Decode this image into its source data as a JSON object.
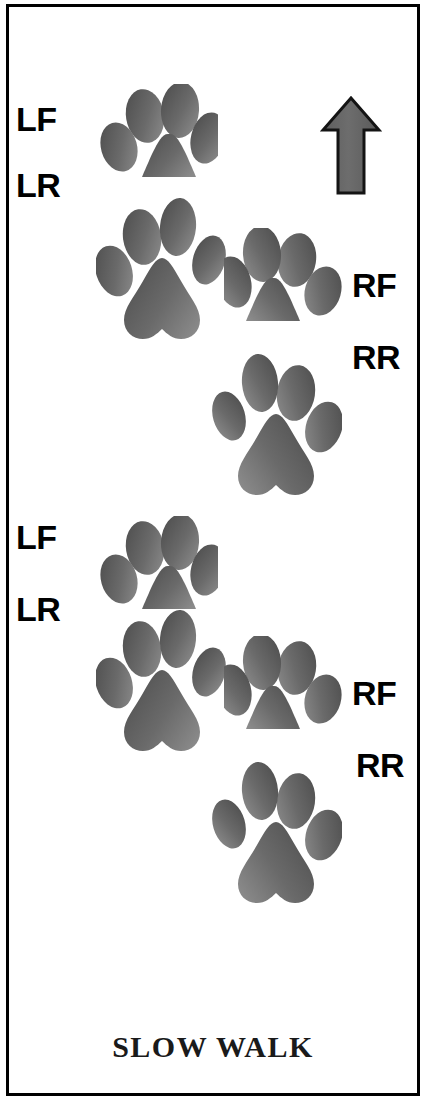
{
  "diagram": {
    "title": "SLOW WALK",
    "caption": "SLOW WALK",
    "direction_icon": "up-arrow-icon",
    "direction": "up",
    "background_color": "#ffffff",
    "border_color": "#000000",
    "paw_color_dark": "#4f4f4f",
    "paw_color_light": "#8a8a8a",
    "label_color": "#000000",
    "caption_color": "#1a1a1a"
  },
  "labels": [
    {
      "id": "lf-1",
      "text": "LF",
      "x": 16,
      "y": 102,
      "side": "left",
      "limb": "left-front"
    },
    {
      "id": "lr-1",
      "text": "LR",
      "x": 16,
      "y": 168,
      "side": "left",
      "limb": "left-rear"
    },
    {
      "id": "rf-1",
      "text": "RF",
      "x": 352,
      "y": 268,
      "side": "right",
      "limb": "right-front"
    },
    {
      "id": "rr-1",
      "text": "RR",
      "x": 352,
      "y": 340,
      "side": "right",
      "limb": "right-rear"
    },
    {
      "id": "lf-2",
      "text": "LF",
      "x": 16,
      "y": 520,
      "side": "left",
      "limb": "left-front"
    },
    {
      "id": "lr-2",
      "text": "LR",
      "x": 16,
      "y": 592,
      "side": "left",
      "limb": "left-rear"
    },
    {
      "id": "rf-2",
      "text": "RF",
      "x": 352,
      "y": 676,
      "side": "right",
      "limb": "right-front"
    },
    {
      "id": "rr-2",
      "text": "RR",
      "x": 356,
      "y": 748,
      "side": "right",
      "limb": "right-rear"
    }
  ],
  "paws": [
    {
      "id": "paw-lf-1",
      "limb": "left-front",
      "type": "front",
      "mirror": false,
      "x": 100,
      "y": 84,
      "w": 118,
      "h": 106
    },
    {
      "id": "paw-lr-1",
      "limb": "left-rear",
      "type": "rear",
      "mirror": false,
      "x": 96,
      "y": 196,
      "w": 130,
      "h": 148
    },
    {
      "id": "paw-rf-1",
      "limb": "right-front",
      "type": "front",
      "mirror": true,
      "x": 224,
      "y": 228,
      "w": 118,
      "h": 106
    },
    {
      "id": "paw-rr-1",
      "limb": "right-rear",
      "type": "rear",
      "mirror": true,
      "x": 212,
      "y": 352,
      "w": 130,
      "h": 148
    },
    {
      "id": "paw-lf-2",
      "limb": "left-front",
      "type": "front",
      "mirror": false,
      "x": 100,
      "y": 516,
      "w": 118,
      "h": 106
    },
    {
      "id": "paw-lr-2",
      "limb": "left-rear",
      "type": "rear",
      "mirror": false,
      "x": 96,
      "y": 608,
      "w": 130,
      "h": 148
    },
    {
      "id": "paw-rf-2",
      "limb": "right-front",
      "type": "front",
      "mirror": true,
      "x": 224,
      "y": 636,
      "w": 118,
      "h": 106
    },
    {
      "id": "paw-rr-2",
      "limb": "right-rear",
      "type": "rear",
      "mirror": true,
      "x": 212,
      "y": 760,
      "w": 130,
      "h": 148
    }
  ]
}
